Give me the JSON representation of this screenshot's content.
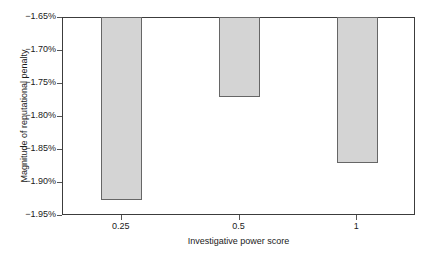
{
  "chart_data": {
    "type": "bar",
    "title": "",
    "xlabel": "Investigative power score",
    "ylabel": "Magnitude of reputational penalty",
    "categories": [
      "0.25",
      "0.5",
      "1"
    ],
    "values": [
      -1.925,
      -1.77,
      -1.87
    ],
    "value_labels": [
      "-1.925%",
      "-1.770%",
      "-1.870%"
    ],
    "ylim": [
      -1.95,
      -1.65
    ],
    "baseline": -1.65,
    "ytick_labels": [
      "−1.65%",
      "−1.70%",
      "−1.75%",
      "−1.80%",
      "−1.85%",
      "−1.90%",
      "−1.95%"
    ],
    "ytick_values": [
      -1.65,
      -1.7,
      -1.75,
      -1.8,
      -1.85,
      -1.9,
      -1.95
    ],
    "grid": false,
    "legend": false,
    "legend_position": "none",
    "bar_fill_color": "#d4d4d4",
    "bar_border_color": "#666666",
    "axis_color": "#3c3c3c",
    "background_color": "#ffffff"
  }
}
